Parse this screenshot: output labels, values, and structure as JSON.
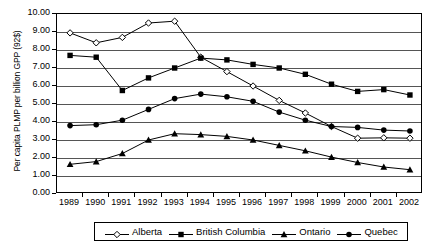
{
  "chart_data": {
    "type": "line",
    "title": "",
    "xlabel": "",
    "ylabel": "Per capita PLMP per billion GPP (92$)",
    "categories": [
      "1989",
      "1990",
      "1991",
      "1992",
      "1993",
      "1994",
      "1995",
      "1996",
      "1997",
      "1998",
      "1999",
      "2000",
      "2001",
      "2002"
    ],
    "x": [
      1989,
      1990,
      1991,
      1992,
      1993,
      1994,
      1995,
      1996,
      1997,
      1998,
      1999,
      2000,
      2001,
      2002
    ],
    "ylim": [
      0.0,
      10.0
    ],
    "ytick_labels": [
      "0.00",
      "1.00",
      "2.00",
      "3.00",
      "4.00",
      "5.00",
      "6.00",
      "7.00",
      "8.00",
      "9.00",
      "10.00"
    ],
    "ytick_values": [
      0,
      1,
      2,
      3,
      4,
      5,
      6,
      7,
      8,
      9,
      10
    ],
    "grid": true,
    "legend_position": "bottom",
    "series": [
      {
        "name": "Alberta",
        "marker": "open-diamond",
        "color": "#000000",
        "values": [
          8.95,
          8.4,
          8.7,
          9.5,
          9.6,
          7.6,
          6.8,
          6.0,
          5.2,
          4.5,
          3.75,
          3.1,
          3.12,
          3.1
        ]
      },
      {
        "name": "British Columbia",
        "marker": "filled-square",
        "color": "#000000",
        "values": [
          7.7,
          7.6,
          5.75,
          6.45,
          7.0,
          7.55,
          7.45,
          7.2,
          7.0,
          6.65,
          6.1,
          5.7,
          5.8,
          5.5
        ]
      },
      {
        "name": "Ontario",
        "marker": "filled-triangle",
        "color": "#000000",
        "values": [
          1.65,
          1.8,
          2.25,
          3.0,
          3.35,
          3.3,
          3.2,
          3.0,
          2.7,
          2.4,
          2.05,
          1.75,
          1.5,
          1.35
        ]
      },
      {
        "name": "Quebec",
        "marker": "filled-circle",
        "color": "#000000",
        "values": [
          3.8,
          3.85,
          4.1,
          4.7,
          5.3,
          5.55,
          5.4,
          5.15,
          4.55,
          4.1,
          3.75,
          3.7,
          3.55,
          3.5
        ]
      }
    ]
  },
  "legend": {
    "items": [
      {
        "label": "Alberta"
      },
      {
        "label": "British Columbia"
      },
      {
        "label": "Ontario"
      },
      {
        "label": "Quebec"
      }
    ]
  }
}
